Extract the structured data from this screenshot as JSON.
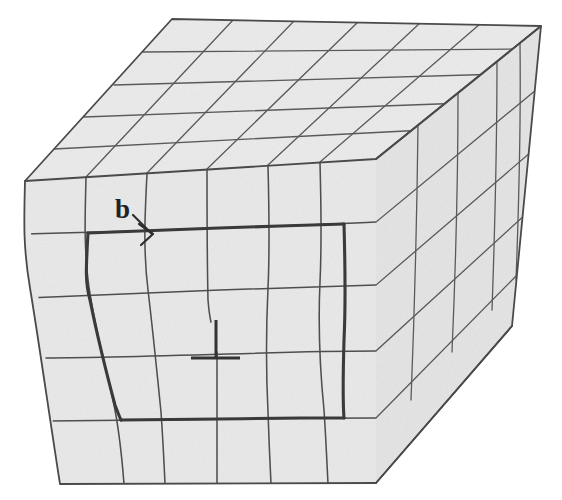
{
  "figure": {
    "kind": "crystal-lattice-edge-dislocation",
    "background_color": "#ffffff",
    "face_fill_color": "#e9e9e9",
    "line_color": "#4e4e4e",
    "bold_line_color": "#3a3a3a",
    "symbol_color": "#333333"
  },
  "annotations": {
    "burgers_vector": {
      "label": "b",
      "icon": "arrow-right-icon",
      "label_x": 115,
      "label_y": 218,
      "arrow_tip_x": 152,
      "arrow_tip_y": 234,
      "meaning": "Burgers vector magnitude and direction"
    },
    "dislocation_symbol": {
      "glyph": "⊥",
      "icon": "inverted-tee-icon",
      "x": 216,
      "y": 320,
      "meaning": "edge dislocation line, extra half-plane terminates here"
    }
  },
  "geometry": {
    "front_face": {
      "name": "front-face",
      "columns": 6,
      "rows": 5,
      "corners": {
        "top_left": [
          25,
          181
        ],
        "top_right": [
          376,
          159
        ],
        "bottom_right": [
          376,
          483
        ],
        "bottom_left": [
          60,
          484
        ]
      }
    },
    "top_face": {
      "name": "top-face",
      "columns": 5,
      "rows": 4,
      "corners": {
        "front_left": [
          25,
          181
        ],
        "back_left": [
          172,
          19
        ],
        "back_right": [
          541,
          26
        ],
        "front_right": [
          376,
          159
        ]
      }
    },
    "right_face": {
      "name": "right-face",
      "columns": 4,
      "rows": 5,
      "corners": {
        "front_top": [
          376,
          159
        ],
        "back_top": [
          541,
          26
        ],
        "back_bottom": [
          512,
          326
        ],
        "front_bottom": [
          376,
          483
        ]
      }
    },
    "burgers_circuit": {
      "name": "burgers-circuit",
      "description": "bold closed loop on the front face around the dislocation core",
      "top_y": 234,
      "bottom_y": 418,
      "left_x": 86,
      "right_x": 342
    }
  },
  "front_face_data": {
    "horizontal_line_y_left": [
      181,
      234,
      298,
      358,
      421,
      484
    ],
    "horizontal_line_y_right": [
      159,
      222,
      285,
      351,
      418,
      483
    ],
    "vertical_line_x_top": [
      25,
      86,
      147,
      207,
      268,
      320,
      376
    ],
    "vertical_line_x_bot": [
      60,
      121,
      163,
      215,
      272,
      328,
      376
    ],
    "distorted_columns": [
      1,
      2,
      4,
      5
    ],
    "extra_half_plane_column": 3
  },
  "top_face_data": {
    "rows": 4,
    "columns": 5,
    "shear_dx": 147,
    "shear_dy": -162
  },
  "right_face_data": {
    "rows": 5,
    "columns": 4,
    "shear_dx": 165,
    "shear_dy": -133
  }
}
